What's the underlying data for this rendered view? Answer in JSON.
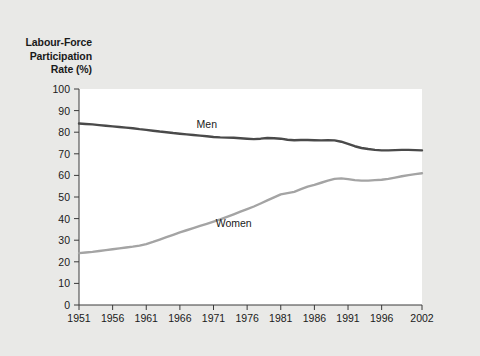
{
  "figure": {
    "background_color": "#e9e9e7",
    "plot_background_color": "#ffffff",
    "axis_color": "#3a3a3a"
  },
  "axis_title": {
    "line1": "Labour-Force",
    "line2": "Participation",
    "line3": "Rate (%)"
  },
  "chart_data": {
    "type": "line",
    "title": "",
    "subtitle": "",
    "xlabel": "",
    "ylabel": "Labour-Force Participation Rate (%)",
    "xlim": [
      1951,
      2002
    ],
    "ylim": [
      0,
      100
    ],
    "yticks": [
      0,
      10,
      20,
      30,
      40,
      50,
      60,
      70,
      80,
      90,
      100
    ],
    "ytick_labels": [
      "0",
      "10",
      "20",
      "30",
      "40",
      "50",
      "60",
      "70",
      "80",
      "90",
      "100"
    ],
    "xticks": [
      1951,
      1956,
      1961,
      1966,
      1971,
      1976,
      1981,
      1986,
      1991,
      1996,
      2002
    ],
    "xtick_labels": [
      "1951",
      "1956",
      "1961",
      "1966",
      "1971",
      "1976",
      "1981",
      "1986",
      "1991",
      "1996",
      "2002"
    ],
    "grid": false,
    "legend_position": "inline-annotation",
    "annotations": [
      {
        "text": "Men",
        "x": 1970,
        "y": 82,
        "series": "Men"
      },
      {
        "text": "Women",
        "x": 1974,
        "y": 36,
        "series": "Women"
      }
    ],
    "series": [
      {
        "name": "Men",
        "color": "#4a4a4a",
        "line_width": 2.4,
        "x": [
          1951,
          1952,
          1953,
          1954,
          1955,
          1956,
          1957,
          1958,
          1959,
          1960,
          1961,
          1962,
          1963,
          1964,
          1965,
          1966,
          1967,
          1968,
          1969,
          1970,
          1971,
          1972,
          1973,
          1974,
          1975,
          1976,
          1977,
          1978,
          1979,
          1980,
          1981,
          1982,
          1983,
          1984,
          1985,
          1986,
          1987,
          1988,
          1989,
          1990,
          1991,
          1992,
          1993,
          1994,
          1995,
          1996,
          1997,
          1998,
          1999,
          2000,
          2001,
          2002
        ],
        "y": [
          84.0,
          83.8,
          83.6,
          83.3,
          83.0,
          82.7,
          82.4,
          82.1,
          81.8,
          81.4,
          81.1,
          80.7,
          80.3,
          80.0,
          79.6,
          79.3,
          79.0,
          78.7,
          78.4,
          78.1,
          77.8,
          77.6,
          77.5,
          77.4,
          77.2,
          77.0,
          76.8,
          77.0,
          77.3,
          77.2,
          77.0,
          76.5,
          76.3,
          76.4,
          76.4,
          76.3,
          76.2,
          76.3,
          76.2,
          75.6,
          74.6,
          73.5,
          72.7,
          72.2,
          71.8,
          71.6,
          71.6,
          71.7,
          71.8,
          71.8,
          71.7,
          71.6
        ]
      },
      {
        "name": "Women",
        "color": "#a4a4a4",
        "line_width": 2.4,
        "x": [
          1951,
          1952,
          1953,
          1954,
          1955,
          1956,
          1957,
          1958,
          1959,
          1960,
          1961,
          1962,
          1963,
          1964,
          1965,
          1966,
          1967,
          1968,
          1969,
          1970,
          1971,
          1972,
          1973,
          1974,
          1975,
          1976,
          1977,
          1978,
          1979,
          1980,
          1981,
          1982,
          1983,
          1984,
          1985,
          1986,
          1987,
          1988,
          1989,
          1990,
          1991,
          1992,
          1993,
          1994,
          1995,
          1996,
          1997,
          1998,
          1999,
          2000,
          2001,
          2002
        ],
        "y": [
          24.0,
          24.3,
          24.6,
          25.0,
          25.4,
          25.8,
          26.2,
          26.6,
          27.0,
          27.5,
          28.2,
          29.2,
          30.3,
          31.4,
          32.5,
          33.6,
          34.6,
          35.6,
          36.6,
          37.6,
          38.6,
          39.6,
          40.8,
          42.0,
          43.2,
          44.4,
          45.6,
          47.0,
          48.4,
          49.8,
          51.2,
          51.8,
          52.4,
          53.6,
          54.8,
          55.6,
          56.6,
          57.6,
          58.4,
          58.6,
          58.3,
          57.8,
          57.6,
          57.6,
          57.8,
          58.0,
          58.4,
          59.0,
          59.6,
          60.1,
          60.6,
          61.0
        ]
      }
    ]
  }
}
